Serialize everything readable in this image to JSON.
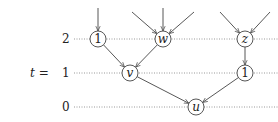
{
  "diagram": {
    "axis_label": "t =",
    "levels": [
      {
        "label": "2",
        "y": 39
      },
      {
        "label": "1",
        "y": 73
      },
      {
        "label": "0",
        "y": 107
      }
    ],
    "nodes": [
      {
        "id": "n1a",
        "label": "1",
        "italic": false,
        "x": 98,
        "y": 39
      },
      {
        "id": "w",
        "label": "w",
        "italic": true,
        "x": 163,
        "y": 39
      },
      {
        "id": "z",
        "label": "z",
        "italic": true,
        "x": 245,
        "y": 39
      },
      {
        "id": "v",
        "label": "v",
        "italic": true,
        "x": 130,
        "y": 73
      },
      {
        "id": "n1b",
        "label": "1",
        "italic": false,
        "x": 245,
        "y": 73
      },
      {
        "id": "u",
        "label": "u",
        "italic": true,
        "x": 196,
        "y": 107
      }
    ],
    "edges": [
      {
        "from": "n1a",
        "to": "v"
      },
      {
        "from": "w",
        "to": "v"
      },
      {
        "from": "v",
        "to": "u"
      },
      {
        "from": "z",
        "to": "n1b"
      },
      {
        "from": "n1b",
        "to": "u"
      }
    ],
    "incoming_stubs": [
      {
        "to": "n1a",
        "from_x": 98,
        "from_y": 8
      },
      {
        "to": "w",
        "from_x": 132,
        "from_y": 12
      },
      {
        "to": "w",
        "from_x": 163,
        "from_y": 8
      },
      {
        "to": "w",
        "from_x": 194,
        "from_y": 12
      },
      {
        "to": "z",
        "from_x": 220,
        "from_y": 12
      },
      {
        "to": "z",
        "from_x": 270,
        "from_y": 12
      }
    ]
  }
}
